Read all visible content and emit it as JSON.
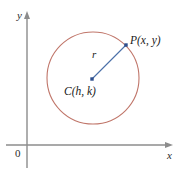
{
  "figure": {
    "colors": {
      "circle_stroke": "#c0766a",
      "radius_line": "#4a6fa8",
      "marker": "#2d4f8e",
      "axis": "#8c8c8c",
      "label_text": "#2b2b2b"
    },
    "axes": {
      "y_label": "y",
      "x_label": "x",
      "origin_label": "0",
      "x_axis_y": 145,
      "y_axis_x": 27,
      "arrowheads": true,
      "grid": false
    },
    "circle": {
      "center_x": 93,
      "center_y": 78,
      "radius": 46,
      "center_label": "C(h, k)",
      "stroke_width": 1.1
    },
    "radius": {
      "label": "r",
      "from_x": 92,
      "from_y": 79,
      "to_x": 126,
      "to_y": 45,
      "stroke_width": 1.1
    },
    "point_p": {
      "label": "P(x, y)",
      "x": 126,
      "y": 45
    }
  }
}
